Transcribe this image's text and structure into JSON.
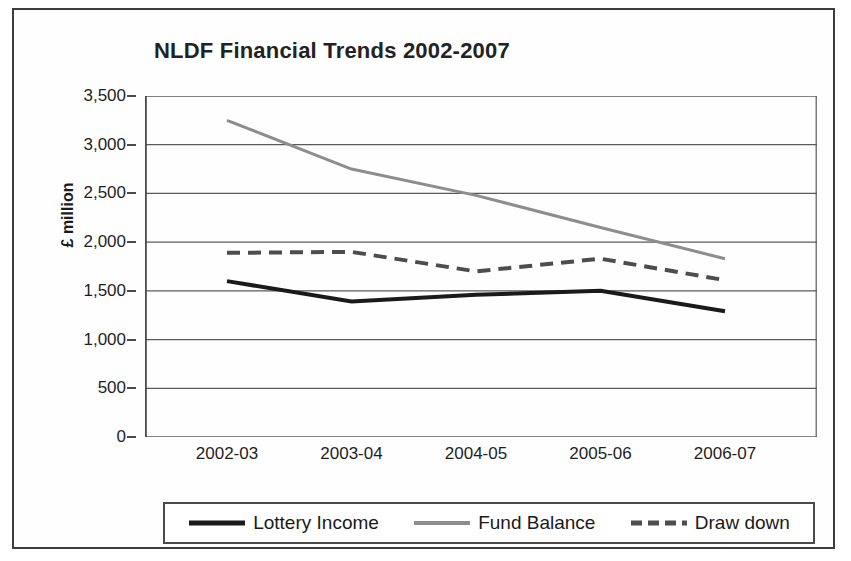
{
  "chart_data": {
    "type": "line",
    "title": "NLDF Financial Trends 2002-2007",
    "xlabel": "",
    "ylabel": "£ million",
    "categories": [
      "2002-03",
      "2003-04",
      "2004-05",
      "2005-06",
      "2006-07"
    ],
    "ylim": [
      0,
      3500
    ],
    "yticks": [
      0,
      500,
      1000,
      1500,
      2000,
      2500,
      3000,
      3500
    ],
    "ytick_labels": [
      "0",
      "500",
      "1,000",
      "1,500",
      "2,000",
      "2,500",
      "3,000",
      "3,500"
    ],
    "grid": "horizontal",
    "legend_position": "bottom",
    "series": [
      {
        "name": "Lottery Income",
        "values": [
          1600,
          1390,
          1460,
          1500,
          1290
        ],
        "color": "#1a1a1a",
        "style": "solid",
        "width": 4
      },
      {
        "name": "Fund Balance",
        "values": [
          3250,
          2750,
          2480,
          2150,
          1830
        ],
        "color": "#8d8d8d",
        "style": "solid",
        "width": 3
      },
      {
        "name": "Draw down",
        "values": [
          1890,
          1900,
          1700,
          1830,
          1610
        ],
        "color": "#4d4d4d",
        "style": "dashed",
        "width": 4
      }
    ]
  },
  "axis": {
    "line_color": "#4a4a4a",
    "grid_color": "#5a5a5a"
  }
}
